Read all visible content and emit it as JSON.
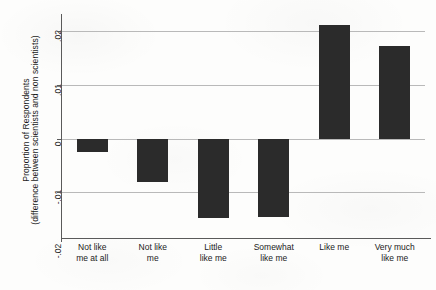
{
  "chart_data": {
    "type": "bar",
    "title": "",
    "subtitle": "",
    "xlabel": "",
    "ylabel": "Proportion of Respondents (difference between scientists and non scientists)",
    "ylabel_lines": [
      "Proportion of Respondents",
      "(difference between scientists and non scientists)"
    ],
    "categories": [
      "Not like me at all",
      "Not like me",
      "Little like me",
      "Somewhat like me",
      "Like me",
      "Very much like me"
    ],
    "category_lines": [
      [
        "Not like",
        "me at all"
      ],
      [
        "Not like",
        "me"
      ],
      [
        "Little",
        "like me"
      ],
      [
        "Somewhat",
        "like me"
      ],
      [
        "Like me",
        ""
      ],
      [
        "Very much",
        "like me"
      ]
    ],
    "values": [
      -0.0025,
      -0.008,
      -0.0148,
      -0.0145,
      0.0212,
      0.0172
    ],
    "ylim": [
      -0.0185,
      0.0225
    ],
    "yticks": [
      0.02,
      0.01,
      0,
      -0.01,
      -0.02
    ],
    "ytick_labels": [
      ".02",
      ".01",
      "0",
      "-.01",
      "-.02"
    ],
    "grid": true,
    "grid_axis": "y",
    "legend": "none",
    "bar_color": "#2b2b2b",
    "grid_color": "#b9b9b9",
    "axis_color": "#5a5a5a",
    "background_color": "#fdfdfc",
    "bar_width_fraction": 0.52
  }
}
